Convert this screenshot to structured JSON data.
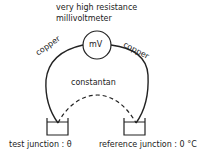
{
  "diagram": {
    "meter": {
      "title_line1": "very high resistance",
      "title_line2": "millivoltmeter",
      "symbol": "mV"
    },
    "wires": {
      "left": "copper",
      "right": "copper",
      "bottom": "constantan"
    },
    "junctions": {
      "test": "test junction : θ",
      "reference": "reference junction : 0 °C"
    },
    "colors": {
      "line": "#222222",
      "background": "#ffffff"
    }
  }
}
